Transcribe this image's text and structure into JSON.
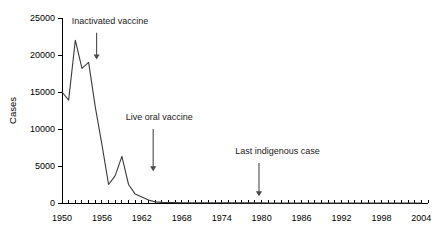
{
  "chart_data": {
    "type": "line",
    "title": "",
    "subtitle": "",
    "xlabel": "",
    "ylabel": "Cases",
    "xlim": [
      1950,
      2005
    ],
    "ylim": [
      0,
      25000
    ],
    "grid": false,
    "legend": "none",
    "x_tick_labels": [
      "1950",
      "1956",
      "1962",
      "1968",
      "1974",
      "1980",
      "1986",
      "1992",
      "1998",
      "2004"
    ],
    "x_tick_values": [
      1950,
      1956,
      1962,
      1968,
      1974,
      1980,
      1986,
      1992,
      1998,
      2004
    ],
    "x_minor_tick_step": 1,
    "y_tick_labels": [
      "0",
      "5000",
      "10000",
      "15000",
      "20000",
      "25000"
    ],
    "y_tick_values": [
      0,
      5000,
      10000,
      15000,
      20000,
      25000
    ],
    "series": [
      {
        "name": "Cases",
        "color": "#3a3a3a",
        "x": [
          1950,
          1951,
          1952,
          1953,
          1954,
          1955,
          1956,
          1957,
          1958,
          1959,
          1960,
          1961,
          1962,
          1963,
          1964,
          1965,
          1966,
          1967,
          1968,
          1969,
          1970,
          1971,
          1972,
          1973,
          1974,
          1975,
          1976,
          1977,
          1978,
          1979,
          1980,
          1981,
          1982,
          1983,
          1984,
          1985,
          1986,
          1987,
          1988,
          1989,
          1990,
          1991,
          1992,
          1993,
          1994,
          1995,
          1996,
          1997,
          1998,
          1999,
          2000,
          2001,
          2002,
          2003,
          2004
        ],
        "values": [
          15000,
          13900,
          22000,
          18200,
          19000,
          13000,
          7900,
          2500,
          3700,
          6300,
          2500,
          1200,
          800,
          400,
          150,
          80,
          60,
          45,
          40,
          35,
          33,
          30,
          28,
          26,
          24,
          22,
          20,
          18,
          16,
          25,
          12,
          10,
          9,
          8,
          7,
          7,
          6,
          6,
          5,
          5,
          5,
          5,
          4,
          4,
          4,
          4,
          3,
          3,
          3,
          3,
          3,
          2,
          2,
          2,
          2
        ]
      }
    ],
    "annotations": [
      {
        "id": "inactivated-vaccine",
        "label": "Inactivated vaccine",
        "text_x": 1957.2,
        "text_y": 24200,
        "arrow_x": 1955.2,
        "arrow_y_start": 23000,
        "arrow_y_end": 19400
      },
      {
        "id": "live-oral-vaccine",
        "label": "Live oral vaccine",
        "text_x": 1964.6,
        "text_y": 11200,
        "arrow_x": 1963.7,
        "arrow_y_start": 10000,
        "arrow_y_end": 4300
      },
      {
        "id": "last-indigenous-case",
        "label": "Last indigenous case",
        "text_x": 1982.4,
        "text_y": 6600,
        "arrow_x": 1979.6,
        "arrow_y_start": 5400,
        "arrow_y_end": 900
      }
    ]
  }
}
